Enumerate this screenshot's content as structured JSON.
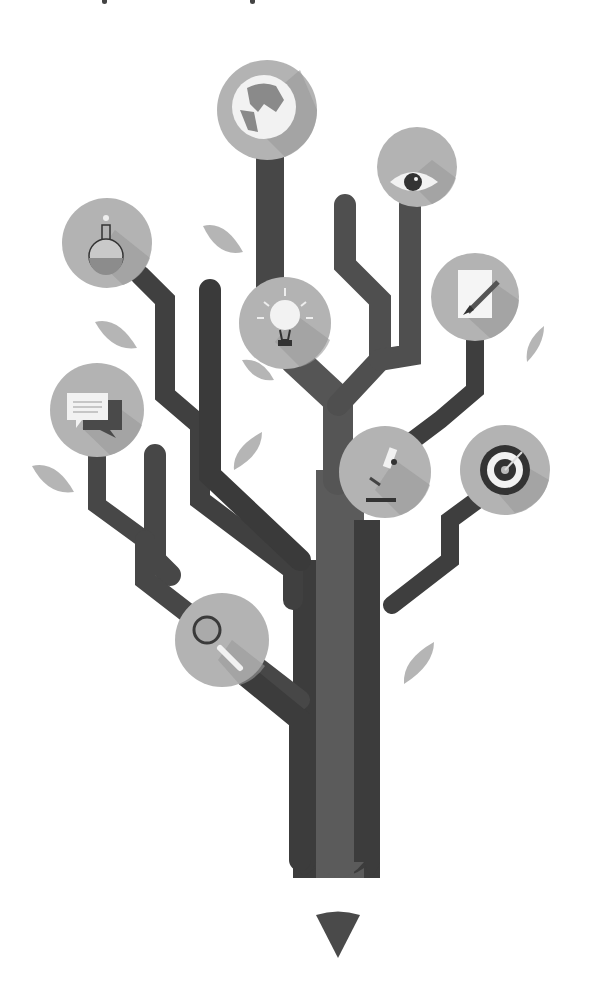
{
  "illustration": {
    "title": "Pencil tree of knowledge",
    "background": "#ffffff",
    "colors": {
      "trunk_dark": "#3f3f3f",
      "trunk_mid": "#5a5a5a",
      "branch": "#474747",
      "badge": "#b3b3b3",
      "badge_shadow": "#9b9b9b",
      "leaf": "#b8b8b8",
      "icon_light": "#f2f2f2",
      "icon_dark": "#333333"
    },
    "icons": [
      {
        "name": "globe-icon",
        "cx": 267,
        "cy": 110,
        "r": 50
      },
      {
        "name": "eye-icon",
        "cx": 417,
        "cy": 167,
        "r": 40
      },
      {
        "name": "flask-icon",
        "cx": 107,
        "cy": 243,
        "r": 45
      },
      {
        "name": "lightbulb-icon",
        "cx": 285,
        "cy": 323,
        "r": 46
      },
      {
        "name": "document-pen-icon",
        "cx": 475,
        "cy": 297,
        "r": 44
      },
      {
        "name": "speech-bubbles-icon",
        "cx": 97,
        "cy": 410,
        "r": 47
      },
      {
        "name": "microscope-icon",
        "cx": 385,
        "cy": 472,
        "r": 46
      },
      {
        "name": "target-icon",
        "cx": 505,
        "cy": 470,
        "r": 45
      },
      {
        "name": "magnifier-icon",
        "cx": 222,
        "cy": 640,
        "r": 47
      }
    ],
    "pencil_tip": {
      "x": 298,
      "y": 912
    }
  }
}
